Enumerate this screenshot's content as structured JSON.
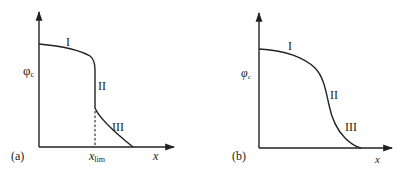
{
  "figure": {
    "panels": [
      {
        "id": "a",
        "panel_label": "(a)",
        "y_axis_label": "φ",
        "y_axis_subscript": "c",
        "x_axis_label": "x",
        "marker_label": "x",
        "marker_subscript": "lim",
        "regions": [
          "I",
          "II",
          "III"
        ],
        "description": "Curve with flat region I, abrupt vertical drop II at x_lim, then decaying region III"
      },
      {
        "id": "b",
        "panel_label": "(b)",
        "y_axis_label": "φ",
        "y_axis_subscript": "c",
        "x_axis_label": "x",
        "regions": [
          "I",
          "II",
          "III"
        ],
        "description": "Smooth sigmoidal decreasing curve with regions I, II, III"
      }
    ],
    "colors": {
      "line": "#222222",
      "background": "#ffffff"
    }
  }
}
